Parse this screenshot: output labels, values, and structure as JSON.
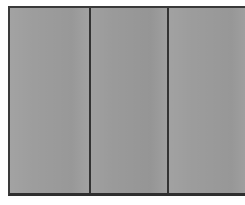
{
  "image": {
    "subject": "three-panel gray partition",
    "caption": "Three flat gray rectangular panels separated by dark vertical dividers, framed by a dark outer border on a white background.",
    "background_color": "#ffffff",
    "frame_color": "#3a3a3a",
    "panel_fill_color": "#9b9b9b",
    "divider_color": "#333333",
    "surface_texture": "dithered-halftone-noise"
  },
  "frame": {
    "label": "panel frame",
    "border_top_px": 2,
    "border_left_px": 2,
    "border_bottom_px": 3,
    "border_right_px": 0
  },
  "panels": [
    {
      "id": "panel-1",
      "label": "Left panel",
      "fill": "#9d9d9d",
      "width_px": 79
    },
    {
      "id": "panel-2",
      "label": "Middle panel",
      "fill": "#9a9a9a",
      "width_px": 76
    },
    {
      "id": "panel-3",
      "label": "Right panel",
      "fill": "#9c9c9c",
      "width_px": 82
    }
  ],
  "dividers": [
    {
      "id": "divider-1",
      "label": "Divider between left and middle panel",
      "x_px": 89,
      "width_px": 2,
      "color": "#333333"
    },
    {
      "id": "divider-2",
      "label": "Divider between middle and right panel",
      "x_px": 165,
      "width_px": 2,
      "color": "#333333"
    }
  ],
  "margins": {
    "left_px": 8,
    "top_px": 6,
    "bottom_px": 6,
    "right_px": 0,
    "color": "#ffffff"
  }
}
